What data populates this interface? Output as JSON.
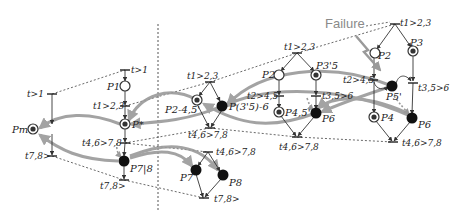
{
  "diagram": {
    "type": "petri-net-recovery",
    "failure_label": "Failure",
    "colors": {
      "arc": "#333333",
      "flow_arrow": "#9a9a9a",
      "dashed": "#444444",
      "failure_text": "#8a8a8a",
      "token": "#111111"
    },
    "places": [
      {
        "id": "pm",
        "label": "Pm",
        "x": 33,
        "y": 129,
        "style": "marked-ring"
      },
      {
        "id": "p1",
        "label": "P1",
        "x": 125,
        "y": 86,
        "style": "empty"
      },
      {
        "id": "pstar",
        "label": "P*",
        "x": 125,
        "y": 124,
        "style": "marked-ring"
      },
      {
        "id": "p78",
        "label": "P7|8",
        "x": 124,
        "y": 161,
        "style": "filled"
      },
      {
        "id": "p2_45",
        "label": "P2-4,5'",
        "x": 197,
        "y": 100,
        "style": "marked-ring"
      },
      {
        "id": "p3_5_6",
        "label": "P(3'5)-6",
        "x": 222,
        "y": 106,
        "style": "filled"
      },
      {
        "id": "p2_mid",
        "label": "P2",
        "x": 279,
        "y": 75,
        "style": "empty"
      },
      {
        "id": "p3_5",
        "label": "P3'5",
        "x": 316,
        "y": 75,
        "style": "marked-ring"
      },
      {
        "id": "p4_5",
        "label": "P4,5'",
        "x": 279,
        "y": 112,
        "style": "marked-ring"
      },
      {
        "id": "p6_mid",
        "label": "P6",
        "x": 316,
        "y": 113,
        "style": "filled"
      },
      {
        "id": "p2_right",
        "label": "P2",
        "x": 375,
        "y": 53,
        "style": "empty"
      },
      {
        "id": "p3_right",
        "label": "P3",
        "x": 413,
        "y": 51,
        "style": "marked-ring"
      },
      {
        "id": "p5_right",
        "label": "P5'",
        "x": 392,
        "y": 86,
        "style": "filled"
      },
      {
        "id": "p4_right",
        "label": "P4",
        "x": 374,
        "y": 117,
        "style": "marked-ring"
      },
      {
        "id": "p6_right",
        "label": "P6",
        "x": 412,
        "y": 118,
        "style": "filled"
      },
      {
        "id": "p7",
        "label": "P7",
        "x": 196,
        "y": 170,
        "style": "filled"
      },
      {
        "id": "p8",
        "label": "P8",
        "x": 223,
        "y": 175,
        "style": "filled"
      }
    ],
    "transitions": [
      {
        "label": "t>1",
        "x": 52,
        "y": 94
      },
      {
        "label": "t>1",
        "x": 125,
        "y": 70
      },
      {
        "label": "t1>2,3",
        "x": 125,
        "y": 106
      },
      {
        "label": "t4,6>7,8",
        "x": 125,
        "y": 143
      },
      {
        "label": "t7,8>",
        "x": 52,
        "y": 156
      },
      {
        "label": "t7,8>",
        "x": 124,
        "y": 180
      },
      {
        "label": "t1>2,3",
        "x": 210,
        "y": 82
      },
      {
        "label": "t4,6>7,8",
        "x": 210,
        "y": 128
      },
      {
        "label": "t1>2,3",
        "x": 297,
        "y": 53
      },
      {
        "label": "t2>4,5",
        "x": 279,
        "y": 96
      },
      {
        "label": "t3,5>6",
        "x": 316,
        "y": 96
      },
      {
        "label": "t4,6>7,8",
        "x": 297,
        "y": 137
      },
      {
        "label": "t1>2,3",
        "x": 395,
        "y": 24
      },
      {
        "label": "t2>4,5",
        "x": 373,
        "y": 79
      },
      {
        "label": "t3,5>6",
        "x": 413,
        "y": 82
      },
      {
        "label": "t4,6>7,8",
        "x": 393,
        "y": 142
      },
      {
        "label": "t4,6>7,8",
        "x": 208,
        "y": 152
      },
      {
        "label": "t7,8>",
        "x": 204,
        "y": 198
      }
    ]
  }
}
